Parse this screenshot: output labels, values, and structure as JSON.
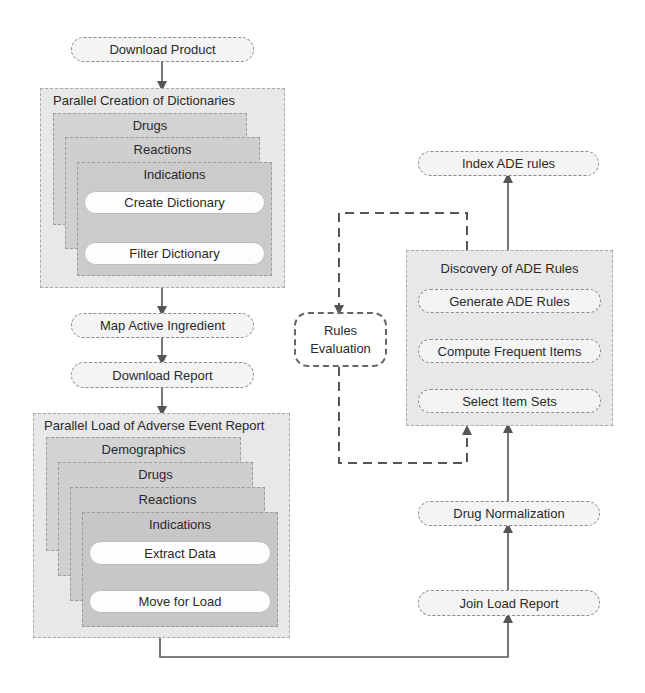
{
  "left_flow": {
    "download_product": "Download Product",
    "dictionaries_group": {
      "title": "Parallel Creation of Dictionaries",
      "layers": [
        "Drugs",
        "Reactions",
        "Indications"
      ],
      "steps": [
        "Create Dictionary",
        "Filter Dictionary"
      ]
    },
    "map_active_ingredient": "Map Active Ingredient",
    "download_report": "Download Report",
    "load_group": {
      "title": "Parallel Load of Adverse Event Report",
      "layers": [
        "Demographics",
        "Drugs",
        "Reactions",
        "Indications"
      ],
      "steps": [
        "Extract Data",
        "Move for Load"
      ]
    }
  },
  "right_flow": {
    "index_ade_rules": "Index ADE rules",
    "discovery_group": {
      "title": "Discovery of ADE Rules",
      "steps": [
        "Generate ADE Rules",
        "Compute Frequent Items",
        "Select Item Sets"
      ]
    },
    "drug_normalization": "Drug Normalization",
    "join_load_report": "Join Load Report"
  },
  "rules_evaluation": {
    "line1": "Rules",
    "line2": "Evaluation"
  },
  "colors": {
    "arrow": "#555555",
    "group_bg": "#e8e8e8",
    "layer_bg": "#d0d0d0",
    "pill_bg": "#f4f4f4"
  }
}
